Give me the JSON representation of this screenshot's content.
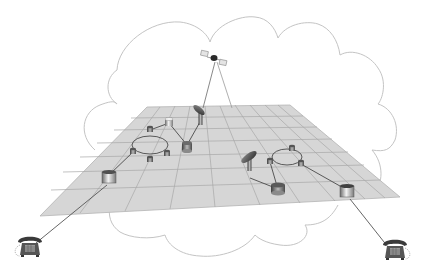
{
  "diagram": {
    "type": "network-topology",
    "colors": {
      "background": "#ffffff",
      "cloud_outline": "#c4c4c4",
      "plane_fill": "#d6d6d6",
      "plane_grid": "#a8a8a8",
      "link_line": "#4a4a4a",
      "satellite_beam": "#9a9a9a",
      "device_dark": "#5a5a5a",
      "device_light": "#e6e6e6"
    },
    "nodes": [
      {
        "id": "satellite",
        "kind": "satellite",
        "x": 214,
        "y": 59
      },
      {
        "id": "dish-left",
        "kind": "satellite-dish",
        "x": 200,
        "y": 118
      },
      {
        "id": "dish-right",
        "kind": "satellite-dish",
        "x": 250,
        "y": 165
      },
      {
        "id": "router-top",
        "kind": "router",
        "x": 169,
        "y": 123
      },
      {
        "id": "router-mid",
        "kind": "router",
        "x": 187,
        "y": 147
      },
      {
        "id": "ring-left-n1",
        "kind": "hub",
        "x": 150,
        "y": 129
      },
      {
        "id": "ring-left-n2",
        "kind": "hub",
        "x": 133,
        "y": 152
      },
      {
        "id": "ring-left-n3",
        "kind": "hub",
        "x": 150,
        "y": 160
      },
      {
        "id": "ring-left-n4",
        "kind": "hub",
        "x": 167,
        "y": 154
      },
      {
        "id": "edge-router-left",
        "kind": "edge-router",
        "x": 109,
        "y": 178
      },
      {
        "id": "ring-right-n1",
        "kind": "hub",
        "x": 292,
        "y": 149
      },
      {
        "id": "ring-right-n2",
        "kind": "hub",
        "x": 270,
        "y": 162
      },
      {
        "id": "ring-right-n3",
        "kind": "hub",
        "x": 301,
        "y": 164
      },
      {
        "id": "router-right-low",
        "kind": "router",
        "x": 278,
        "y": 189
      },
      {
        "id": "edge-router-right",
        "kind": "edge-router",
        "x": 347,
        "y": 192
      },
      {
        "id": "phone-left",
        "kind": "telephone",
        "x": 30,
        "y": 248
      },
      {
        "id": "phone-right",
        "kind": "telephone",
        "x": 395,
        "y": 251
      }
    ]
  }
}
